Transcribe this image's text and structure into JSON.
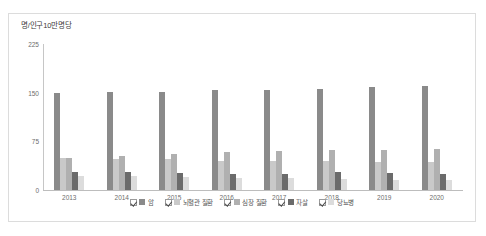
{
  "chart_data": {
    "type": "bar",
    "title": "",
    "subtitle": "",
    "unit_caption": "명/인구10만명당",
    "xlabel": "",
    "ylabel": "",
    "ylim": [
      0,
      225
    ],
    "yticks": [
      0,
      75,
      150,
      225
    ],
    "ytick_labels": [
      "0",
      "75",
      "150",
      "225"
    ],
    "grid": false,
    "legend_position": "bottom",
    "categories": [
      "2013",
      "2014",
      "2015",
      "2016",
      "2017",
      "2018",
      "2019",
      "2020"
    ],
    "series": [
      {
        "name": "암",
        "color": "#8a8a8a",
        "checked": true,
        "values": [
          149,
          151,
          151,
          154,
          154,
          155,
          159,
          161
        ]
      },
      {
        "name": "뇌혈관 질환",
        "color": "#c9c9c9",
        "checked": true,
        "values": [
          50,
          48,
          48,
          45,
          45,
          44,
          43,
          43
        ]
      },
      {
        "name": "심장 질환",
        "color": "#b0b0b0",
        "checked": true,
        "values": [
          50,
          53,
          55,
          59,
          60,
          62,
          61,
          63
        ]
      },
      {
        "name": "자살",
        "color": "#6b6b6b",
        "checked": true,
        "values": [
          28,
          27,
          26,
          25,
          24,
          27,
          26,
          25
        ]
      },
      {
        "name": "당뇨병",
        "color": "#dcdcdc",
        "checked": true,
        "values": [
          21,
          21,
          20,
          19,
          18,
          17,
          15,
          16
        ]
      }
    ]
  }
}
